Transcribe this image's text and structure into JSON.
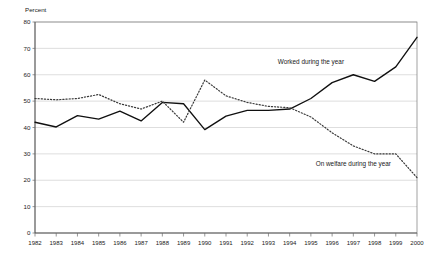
{
  "chart_data": {
    "type": "line",
    "title": "",
    "ylabel": "Percent",
    "xlabel": "",
    "ylim": [
      0,
      80
    ],
    "ytick_step": 10,
    "yticks": [
      "0",
      "10",
      "20",
      "30",
      "40",
      "50",
      "60",
      "70",
      "80"
    ],
    "grid": true,
    "legend_position": "inline-annotation",
    "categories": [
      "1982",
      "1983",
      "1984",
      "1985",
      "1986",
      "1987",
      "1988",
      "1989",
      "1990",
      "1991",
      "1992",
      "1993",
      "1994",
      "1995",
      "1996",
      "1997",
      "1998",
      "1999",
      "2000"
    ],
    "series": [
      {
        "name": "Worked during the year",
        "style": "solid",
        "color": "#101010",
        "values": [
          42.0,
          40.2,
          44.5,
          43.2,
          46.2,
          42.5,
          49.5,
          49.0,
          39.2,
          44.3,
          46.5,
          46.5,
          47.0,
          51.0,
          57.0,
          60.0,
          57.5,
          63.0,
          74.2
        ]
      },
      {
        "name": "On welfare during the year",
        "style": "dotted",
        "color": "#3a3a3a",
        "values": [
          51.0,
          50.5,
          51.0,
          52.5,
          49.0,
          47.0,
          50.0,
          42.0,
          58.0,
          52.0,
          49.5,
          48.0,
          47.5,
          44.0,
          38.0,
          33.0,
          30.0,
          30.0,
          21.0
        ]
      }
    ],
    "annotations": [
      {
        "text": "Worked during the year",
        "year": "1995",
        "value": 64.0
      },
      {
        "text": "On welfare during the year",
        "year": "1997",
        "value": 25.5
      }
    ]
  }
}
